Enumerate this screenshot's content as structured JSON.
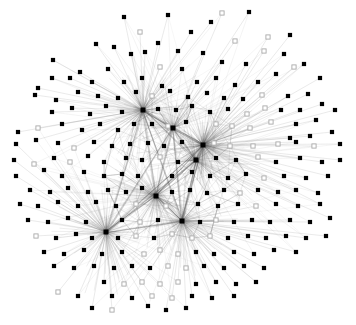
{
  "figure": {
    "title": "",
    "background_color": "#ffffff",
    "width": 356,
    "height": 325
  },
  "style": {
    "node_filled_color": "#000000",
    "node_hollow_fill": "#ffffff",
    "node_hollow_stroke": "#a8a8a8",
    "edge_color": "#9a9a9a",
    "edge_color_dense": "#555555",
    "node_size": 4.2,
    "node_size_hub": 5.0,
    "edge_width": 0.35
  },
  "chart_data": {
    "type": "scatter",
    "title": "",
    "xlabel": "",
    "ylabel": "",
    "grid": false,
    "legend": null,
    "xlim": [
      0,
      356
    ],
    "ylim": [
      0,
      325
    ],
    "node_count": 232,
    "edge_count": 1180,
    "hub_count": 5,
    "node_types": [
      "filled",
      "hollow"
    ],
    "hubs": [
      {
        "id": "h0",
        "x": 203,
        "y": 145,
        "degree": 150
      },
      {
        "id": "h1",
        "x": 156,
        "y": 196,
        "degree": 120
      },
      {
        "id": "h2",
        "x": 143,
        "y": 110,
        "degree": 95
      },
      {
        "id": "h3",
        "x": 182,
        "y": 221,
        "degree": 90
      },
      {
        "id": "h4",
        "x": 106,
        "y": 232,
        "degree": 70
      },
      {
        "id": "h5",
        "x": 196,
        "y": 160,
        "degree": 80
      },
      {
        "id": "h6",
        "x": 173,
        "y": 128,
        "degree": 60
      }
    ],
    "nodes": [
      {
        "x": 168,
        "y": 15,
        "t": "f"
      },
      {
        "x": 222,
        "y": 13,
        "t": "h"
      },
      {
        "x": 124,
        "y": 17,
        "t": "f"
      },
      {
        "x": 249,
        "y": 12,
        "t": "f"
      },
      {
        "x": 96,
        "y": 44,
        "t": "f"
      },
      {
        "x": 140,
        "y": 32,
        "t": "h"
      },
      {
        "x": 191,
        "y": 32,
        "t": "f"
      },
      {
        "x": 211,
        "y": 22,
        "t": "f"
      },
      {
        "x": 235,
        "y": 41,
        "t": "h"
      },
      {
        "x": 268,
        "y": 37,
        "t": "h"
      },
      {
        "x": 290,
        "y": 35,
        "t": "f"
      },
      {
        "x": 158,
        "y": 43,
        "t": "f"
      },
      {
        "x": 114,
        "y": 47,
        "t": "f"
      },
      {
        "x": 178,
        "y": 51,
        "t": "f"
      },
      {
        "x": 53,
        "y": 60,
        "t": "f"
      },
      {
        "x": 70,
        "y": 78,
        "t": "f"
      },
      {
        "x": 131,
        "y": 54,
        "t": "f"
      },
      {
        "x": 145,
        "y": 52,
        "t": "f"
      },
      {
        "x": 203,
        "y": 53,
        "t": "f"
      },
      {
        "x": 222,
        "y": 62,
        "t": "f"
      },
      {
        "x": 246,
        "y": 64,
        "t": "f"
      },
      {
        "x": 264,
        "y": 51,
        "t": "h"
      },
      {
        "x": 284,
        "y": 54,
        "t": "f"
      },
      {
        "x": 304,
        "y": 64,
        "t": "f"
      },
      {
        "x": 108,
        "y": 69,
        "t": "f"
      },
      {
        "x": 160,
        "y": 67,
        "t": "h"
      },
      {
        "x": 182,
        "y": 69,
        "t": "f"
      },
      {
        "x": 276,
        "y": 74,
        "t": "f"
      },
      {
        "x": 294,
        "y": 67,
        "t": "h"
      },
      {
        "x": 38,
        "y": 88,
        "t": "f"
      },
      {
        "x": 52,
        "y": 78,
        "t": "f"
      },
      {
        "x": 80,
        "y": 72,
        "t": "f"
      },
      {
        "x": 92,
        "y": 82,
        "t": "f"
      },
      {
        "x": 124,
        "y": 82,
        "t": "f"
      },
      {
        "x": 142,
        "y": 78,
        "t": "f"
      },
      {
        "x": 162,
        "y": 86,
        "t": "f"
      },
      {
        "x": 197,
        "y": 82,
        "t": "f"
      },
      {
        "x": 216,
        "y": 78,
        "t": "f"
      },
      {
        "x": 235,
        "y": 85,
        "t": "f"
      },
      {
        "x": 258,
        "y": 82,
        "t": "f"
      },
      {
        "x": 320,
        "y": 78,
        "t": "f"
      },
      {
        "x": 288,
        "y": 96,
        "t": "f"
      },
      {
        "x": 308,
        "y": 94,
        "t": "f"
      },
      {
        "x": 35,
        "y": 95,
        "t": "f"
      },
      {
        "x": 56,
        "y": 100,
        "t": "f"
      },
      {
        "x": 78,
        "y": 92,
        "t": "f"
      },
      {
        "x": 98,
        "y": 96,
        "t": "f"
      },
      {
        "x": 118,
        "y": 98,
        "t": "f"
      },
      {
        "x": 136,
        "y": 92,
        "t": "f"
      },
      {
        "x": 152,
        "y": 96,
        "t": "h"
      },
      {
        "x": 170,
        "y": 91,
        "t": "f"
      },
      {
        "x": 188,
        "y": 97,
        "t": "f"
      },
      {
        "x": 207,
        "y": 93,
        "t": "f"
      },
      {
        "x": 224,
        "y": 98,
        "t": "f"
      },
      {
        "x": 243,
        "y": 99,
        "t": "f"
      },
      {
        "x": 262,
        "y": 95,
        "t": "h"
      },
      {
        "x": 281,
        "y": 110,
        "t": "f"
      },
      {
        "x": 300,
        "y": 110,
        "t": "f"
      },
      {
        "x": 322,
        "y": 104,
        "t": "f"
      },
      {
        "x": 52,
        "y": 112,
        "t": "f"
      },
      {
        "x": 72,
        "y": 108,
        "t": "f"
      },
      {
        "x": 90,
        "y": 114,
        "t": "f"
      },
      {
        "x": 106,
        "y": 106,
        "t": "f"
      },
      {
        "x": 122,
        "y": 112,
        "t": "f"
      },
      {
        "x": 158,
        "y": 109,
        "t": "f"
      },
      {
        "x": 176,
        "y": 110,
        "t": "f"
      },
      {
        "x": 192,
        "y": 106,
        "t": "f"
      },
      {
        "x": 210,
        "y": 112,
        "t": "f"
      },
      {
        "x": 228,
        "y": 109,
        "t": "f"
      },
      {
        "x": 247,
        "y": 114,
        "t": "h"
      },
      {
        "x": 265,
        "y": 108,
        "t": "h"
      },
      {
        "x": 296,
        "y": 124,
        "t": "f"
      },
      {
        "x": 316,
        "y": 120,
        "t": "f"
      },
      {
        "x": 335,
        "y": 110,
        "t": "f"
      },
      {
        "x": 18,
        "y": 132,
        "t": "f"
      },
      {
        "x": 38,
        "y": 128,
        "t": "h"
      },
      {
        "x": 62,
        "y": 124,
        "t": "f"
      },
      {
        "x": 82,
        "y": 130,
        "t": "f"
      },
      {
        "x": 100,
        "y": 124,
        "t": "f"
      },
      {
        "x": 118,
        "y": 130,
        "t": "f"
      },
      {
        "x": 134,
        "y": 124,
        "t": "f"
      },
      {
        "x": 152,
        "y": 124,
        "t": "f"
      },
      {
        "x": 168,
        "y": 126,
        "t": "h"
      },
      {
        "x": 186,
        "y": 122,
        "t": "f"
      },
      {
        "x": 216,
        "y": 124,
        "t": "h"
      },
      {
        "x": 232,
        "y": 126,
        "t": "h"
      },
      {
        "x": 250,
        "y": 128,
        "t": "h"
      },
      {
        "x": 271,
        "y": 122,
        "t": "h"
      },
      {
        "x": 290,
        "y": 138,
        "t": "f"
      },
      {
        "x": 310,
        "y": 136,
        "t": "f"
      },
      {
        "x": 332,
        "y": 132,
        "t": "f"
      },
      {
        "x": 16,
        "y": 144,
        "t": "f"
      },
      {
        "x": 36,
        "y": 140,
        "t": "f"
      },
      {
        "x": 58,
        "y": 143,
        "t": "f"
      },
      {
        "x": 74,
        "y": 148,
        "t": "h"
      },
      {
        "x": 94,
        "y": 142,
        "t": "f"
      },
      {
        "x": 112,
        "y": 146,
        "t": "f"
      },
      {
        "x": 130,
        "y": 144,
        "t": "f"
      },
      {
        "x": 148,
        "y": 143,
        "t": "f"
      },
      {
        "x": 164,
        "y": 146,
        "t": "f"
      },
      {
        "x": 182,
        "y": 142,
        "t": "f"
      },
      {
        "x": 214,
        "y": 143,
        "t": "h"
      },
      {
        "x": 230,
        "y": 146,
        "t": "h"
      },
      {
        "x": 253,
        "y": 146,
        "t": "h"
      },
      {
        "x": 278,
        "y": 144,
        "t": "h"
      },
      {
        "x": 296,
        "y": 142,
        "t": "f"
      },
      {
        "x": 314,
        "y": 146,
        "t": "h"
      },
      {
        "x": 340,
        "y": 144,
        "t": "f"
      },
      {
        "x": 14,
        "y": 160,
        "t": "f"
      },
      {
        "x": 34,
        "y": 164,
        "t": "h"
      },
      {
        "x": 54,
        "y": 158,
        "t": "f"
      },
      {
        "x": 70,
        "y": 162,
        "t": "h"
      },
      {
        "x": 88,
        "y": 156,
        "t": "f"
      },
      {
        "x": 104,
        "y": 162,
        "t": "f"
      },
      {
        "x": 126,
        "y": 158,
        "t": "f"
      },
      {
        "x": 142,
        "y": 160,
        "t": "f"
      },
      {
        "x": 160,
        "y": 157,
        "t": "h"
      },
      {
        "x": 178,
        "y": 162,
        "t": "f"
      },
      {
        "x": 216,
        "y": 158,
        "t": "f"
      },
      {
        "x": 236,
        "y": 160,
        "t": "f"
      },
      {
        "x": 258,
        "y": 157,
        "t": "h"
      },
      {
        "x": 276,
        "y": 162,
        "t": "f"
      },
      {
        "x": 300,
        "y": 158,
        "t": "f"
      },
      {
        "x": 322,
        "y": 162,
        "t": "f"
      },
      {
        "x": 340,
        "y": 160,
        "t": "f"
      },
      {
        "x": 16,
        "y": 176,
        "t": "f"
      },
      {
        "x": 44,
        "y": 170,
        "t": "f"
      },
      {
        "x": 62,
        "y": 176,
        "t": "f"
      },
      {
        "x": 84,
        "y": 172,
        "t": "f"
      },
      {
        "x": 104,
        "y": 176,
        "t": "f"
      },
      {
        "x": 122,
        "y": 174,
        "t": "f"
      },
      {
        "x": 138,
        "y": 176,
        "t": "f"
      },
      {
        "x": 172,
        "y": 176,
        "t": "f"
      },
      {
        "x": 192,
        "y": 172,
        "t": "f"
      },
      {
        "x": 210,
        "y": 176,
        "t": "f"
      },
      {
        "x": 228,
        "y": 178,
        "t": "f"
      },
      {
        "x": 246,
        "y": 174,
        "t": "f"
      },
      {
        "x": 264,
        "y": 178,
        "t": "h"
      },
      {
        "x": 284,
        "y": 176,
        "t": "f"
      },
      {
        "x": 306,
        "y": 178,
        "t": "f"
      },
      {
        "x": 328,
        "y": 176,
        "t": "f"
      },
      {
        "x": 30,
        "y": 190,
        "t": "f"
      },
      {
        "x": 50,
        "y": 192,
        "t": "f"
      },
      {
        "x": 68,
        "y": 188,
        "t": "f"
      },
      {
        "x": 88,
        "y": 192,
        "t": "f"
      },
      {
        "x": 108,
        "y": 190,
        "t": "f"
      },
      {
        "x": 126,
        "y": 192,
        "t": "f"
      },
      {
        "x": 142,
        "y": 188,
        "t": "f"
      },
      {
        "x": 172,
        "y": 192,
        "t": "f"
      },
      {
        "x": 190,
        "y": 190,
        "t": "f"
      },
      {
        "x": 207,
        "y": 193,
        "t": "f"
      },
      {
        "x": 224,
        "y": 190,
        "t": "f"
      },
      {
        "x": 240,
        "y": 193,
        "t": "h"
      },
      {
        "x": 258,
        "y": 190,
        "t": "f"
      },
      {
        "x": 278,
        "y": 192,
        "t": "f"
      },
      {
        "x": 296,
        "y": 190,
        "t": "f"
      },
      {
        "x": 318,
        "y": 193,
        "t": "f"
      },
      {
        "x": 20,
        "y": 204,
        "t": "f"
      },
      {
        "x": 38,
        "y": 206,
        "t": "f"
      },
      {
        "x": 58,
        "y": 202,
        "t": "f"
      },
      {
        "x": 78,
        "y": 206,
        "t": "f"
      },
      {
        "x": 96,
        "y": 202,
        "t": "f"
      },
      {
        "x": 116,
        "y": 206,
        "t": "f"
      },
      {
        "x": 136,
        "y": 204,
        "t": "h"
      },
      {
        "x": 166,
        "y": 206,
        "t": "h"
      },
      {
        "x": 198,
        "y": 204,
        "t": "f"
      },
      {
        "x": 218,
        "y": 206,
        "t": "f"
      },
      {
        "x": 238,
        "y": 204,
        "t": "f"
      },
      {
        "x": 256,
        "y": 206,
        "t": "h"
      },
      {
        "x": 276,
        "y": 204,
        "t": "f"
      },
      {
        "x": 298,
        "y": 206,
        "t": "f"
      },
      {
        "x": 320,
        "y": 204,
        "t": "f"
      },
      {
        "x": 28,
        "y": 220,
        "t": "f"
      },
      {
        "x": 48,
        "y": 222,
        "t": "f"
      },
      {
        "x": 68,
        "y": 218,
        "t": "f"
      },
      {
        "x": 86,
        "y": 222,
        "t": "f"
      },
      {
        "x": 122,
        "y": 220,
        "t": "f"
      },
      {
        "x": 140,
        "y": 222,
        "t": "h"
      },
      {
        "x": 158,
        "y": 220,
        "t": "f"
      },
      {
        "x": 200,
        "y": 222,
        "t": "f"
      },
      {
        "x": 216,
        "y": 220,
        "t": "h"
      },
      {
        "x": 234,
        "y": 222,
        "t": "f"
      },
      {
        "x": 252,
        "y": 220,
        "t": "f"
      },
      {
        "x": 270,
        "y": 222,
        "t": "f"
      },
      {
        "x": 290,
        "y": 220,
        "t": "f"
      },
      {
        "x": 310,
        "y": 222,
        "t": "f"
      },
      {
        "x": 330,
        "y": 218,
        "t": "f"
      },
      {
        "x": 36,
        "y": 236,
        "t": "h"
      },
      {
        "x": 56,
        "y": 238,
        "t": "f"
      },
      {
        "x": 76,
        "y": 234,
        "t": "f"
      },
      {
        "x": 92,
        "y": 238,
        "t": "f"
      },
      {
        "x": 118,
        "y": 238,
        "t": "f"
      },
      {
        "x": 136,
        "y": 236,
        "t": "h"
      },
      {
        "x": 154,
        "y": 238,
        "t": "f"
      },
      {
        "x": 172,
        "y": 234,
        "t": "h"
      },
      {
        "x": 192,
        "y": 238,
        "t": "h"
      },
      {
        "x": 210,
        "y": 236,
        "t": "h"
      },
      {
        "x": 228,
        "y": 238,
        "t": "f"
      },
      {
        "x": 248,
        "y": 236,
        "t": "f"
      },
      {
        "x": 266,
        "y": 238,
        "t": "f"
      },
      {
        "x": 286,
        "y": 236,
        "t": "f"
      },
      {
        "x": 306,
        "y": 238,
        "t": "f"
      },
      {
        "x": 326,
        "y": 236,
        "t": "f"
      },
      {
        "x": 44,
        "y": 252,
        "t": "f"
      },
      {
        "x": 64,
        "y": 254,
        "t": "f"
      },
      {
        "x": 84,
        "y": 250,
        "t": "f"
      },
      {
        "x": 102,
        "y": 254,
        "t": "f"
      },
      {
        "x": 122,
        "y": 252,
        "t": "f"
      },
      {
        "x": 144,
        "y": 254,
        "t": "h"
      },
      {
        "x": 160,
        "y": 250,
        "t": "h"
      },
      {
        "x": 178,
        "y": 254,
        "t": "h"
      },
      {
        "x": 196,
        "y": 252,
        "t": "f"
      },
      {
        "x": 214,
        "y": 254,
        "t": "f"
      },
      {
        "x": 234,
        "y": 252,
        "t": "f"
      },
      {
        "x": 254,
        "y": 254,
        "t": "f"
      },
      {
        "x": 274,
        "y": 250,
        "t": "f"
      },
      {
        "x": 296,
        "y": 252,
        "t": "f"
      },
      {
        "x": 54,
        "y": 266,
        "t": "f"
      },
      {
        "x": 74,
        "y": 268,
        "t": "f"
      },
      {
        "x": 94,
        "y": 266,
        "t": "f"
      },
      {
        "x": 114,
        "y": 268,
        "t": "f"
      },
      {
        "x": 132,
        "y": 266,
        "t": "f"
      },
      {
        "x": 150,
        "y": 268,
        "t": "f"
      },
      {
        "x": 168,
        "y": 266,
        "t": "h"
      },
      {
        "x": 186,
        "y": 268,
        "t": "h"
      },
      {
        "x": 204,
        "y": 266,
        "t": "f"
      },
      {
        "x": 224,
        "y": 268,
        "t": "f"
      },
      {
        "x": 244,
        "y": 266,
        "t": "f"
      },
      {
        "x": 264,
        "y": 268,
        "t": "f"
      },
      {
        "x": 104,
        "y": 282,
        "t": "f"
      },
      {
        "x": 124,
        "y": 284,
        "t": "h"
      },
      {
        "x": 142,
        "y": 282,
        "t": "h"
      },
      {
        "x": 160,
        "y": 284,
        "t": "h"
      },
      {
        "x": 178,
        "y": 282,
        "t": "h"
      },
      {
        "x": 196,
        "y": 284,
        "t": "f"
      },
      {
        "x": 216,
        "y": 282,
        "t": "f"
      },
      {
        "x": 236,
        "y": 284,
        "t": "f"
      },
      {
        "x": 256,
        "y": 282,
        "t": "f"
      },
      {
        "x": 58,
        "y": 292,
        "t": "h"
      },
      {
        "x": 78,
        "y": 296,
        "t": "f"
      },
      {
        "x": 112,
        "y": 296,
        "t": "f"
      },
      {
        "x": 132,
        "y": 298,
        "t": "f"
      },
      {
        "x": 152,
        "y": 296,
        "t": "h"
      },
      {
        "x": 172,
        "y": 298,
        "t": "h"
      },
      {
        "x": 192,
        "y": 296,
        "t": "f"
      },
      {
        "x": 212,
        "y": 298,
        "t": "f"
      },
      {
        "x": 234,
        "y": 296,
        "t": "f"
      },
      {
        "x": 92,
        "y": 308,
        "t": "f"
      },
      {
        "x": 112,
        "y": 310,
        "t": "h"
      },
      {
        "x": 148,
        "y": 306,
        "t": "f"
      },
      {
        "x": 166,
        "y": 310,
        "t": "f"
      },
      {
        "x": 186,
        "y": 308,
        "t": "f"
      }
    ]
  }
}
